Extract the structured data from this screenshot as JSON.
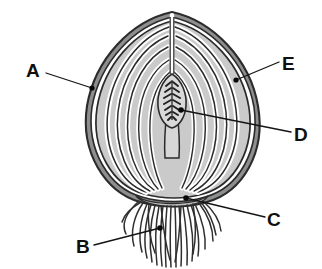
{
  "figure": {
    "background_color": "#ffffff"
  },
  "colors": {
    "outline": "#2b2b2b",
    "scale_fill": "#c9cac9",
    "scale_fill_light": "#d6d7d6",
    "gap_white": "#ffffff",
    "skin": "#3a3a3a",
    "root": "#2f2f2f",
    "label_text": "#101010",
    "leader_line": "#141414",
    "marker_dot": "#080808"
  },
  "labels": [
    {
      "id": "A",
      "text": "A",
      "part": "outer-dry-skin",
      "x": 26,
      "y": 61,
      "leader": {
        "from": [
          46,
          73
        ],
        "to": [
          92,
          88
        ]
      },
      "dot": [
        92,
        88
      ]
    },
    {
      "id": "E",
      "text": "E",
      "part": "fleshy-scale-leaf",
      "x": 282,
      "y": 54,
      "leader": {
        "from": [
          279,
          62
        ],
        "to": [
          236,
          80
        ]
      },
      "dot": [
        236,
        80
      ]
    },
    {
      "id": "D",
      "text": "D",
      "part": "terminal-bud-shoot",
      "x": 294,
      "y": 125,
      "leader": {
        "from": [
          291,
          132
        ],
        "to": [
          181,
          110
        ]
      },
      "dot": [
        181,
        110
      ]
    },
    {
      "id": "C",
      "text": "C",
      "part": "basal-plate-stem",
      "x": 267,
      "y": 210,
      "leader": {
        "from": [
          265,
          217
        ],
        "to": [
          186,
          198
        ]
      },
      "dot": [
        186,
        198
      ]
    },
    {
      "id": "B",
      "text": "B",
      "part": "adventitious-roots",
      "x": 76,
      "y": 237,
      "leader": {
        "from": [
          94,
          245
        ],
        "to": [
          160,
          228
        ]
      },
      "dot": [
        160,
        228
      ]
    }
  ],
  "structure": {
    "apex": [
      172,
      12
    ],
    "bulb_bounds": {
      "left": 86,
      "top": 12,
      "right": 262,
      "bottom": 205
    },
    "scale_layer_count": 6,
    "root_count": 22,
    "bud": {
      "shape": "elongated-oval-with-stalk",
      "bounds": {
        "left": 160,
        "top": 74,
        "right": 186,
        "bottom": 156
      },
      "primordia_pairs": 7
    }
  }
}
